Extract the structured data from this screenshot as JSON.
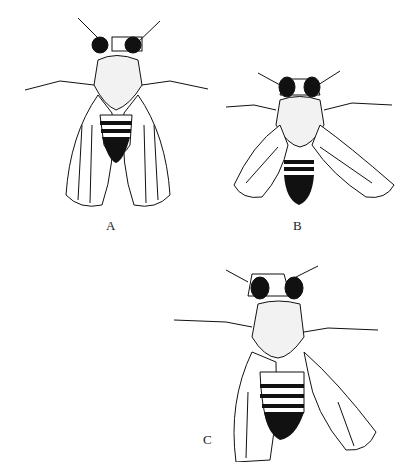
{
  "figure": {
    "panels": [
      {
        "id": "A",
        "label": "A",
        "subject": "fly-dorsal-view-wings-folded"
      },
      {
        "id": "B",
        "label": "B",
        "subject": "fly-dorsal-view-wings-spread"
      },
      {
        "id": "C",
        "label": "C",
        "subject": "fly-dorsal-view-one-wing-folded"
      }
    ],
    "colors": {
      "ink": "#111111",
      "paper": "#ffffff"
    }
  }
}
